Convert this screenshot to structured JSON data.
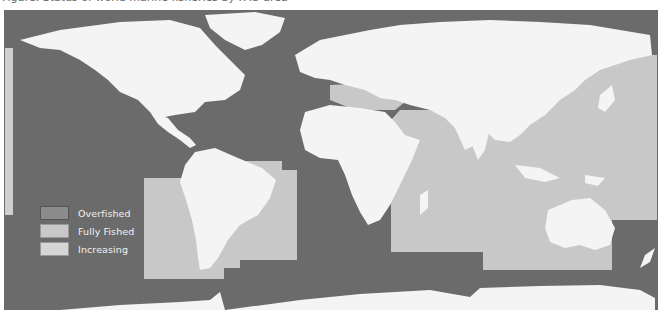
{
  "caption": "Figure: Status of world marine fisheries by FAO area",
  "colors": {
    "ocean": "#6b6b6b",
    "land": "#f4f4f4",
    "overfished": "#8c8c8c",
    "fully_fished": "#c8c8c8",
    "increasing": "#d6d6d6",
    "legend_text": "#f2f2f2"
  },
  "legend": {
    "items": [
      {
        "label": "Overfished",
        "category": "overfished",
        "color": "#8c8c8c"
      },
      {
        "label": "Fully Fished",
        "category": "fully_fished",
        "color": "#c8c8c8"
      },
      {
        "label": "Increasing",
        "category": "increasing",
        "color": "#d6d6d6"
      }
    ]
  },
  "regions": [
    {
      "name": "Mediterranean and Black Sea",
      "status": "fully_fished"
    },
    {
      "name": "Northwest Pacific",
      "status": "fully_fished"
    },
    {
      "name": "Southeast Pacific",
      "status": "fully_fished"
    },
    {
      "name": "Southwest Atlantic",
      "status": "fully_fished"
    },
    {
      "name": "Western Indian Ocean",
      "status": "fully_fished"
    },
    {
      "name": "Eastern Indian Ocean",
      "status": "fully_fished"
    },
    {
      "name": "Western Central Pacific",
      "status": "fully_fished"
    },
    {
      "name": "Northeast Pacific (strip)",
      "status": "increasing"
    }
  ]
}
